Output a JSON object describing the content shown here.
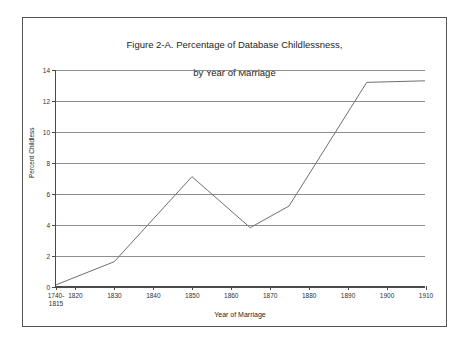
{
  "figure": {
    "title_line1": "Figure 2-A.  Percentage of Database Childlessness,",
    "title_line2": "by Year of Marriage"
  },
  "chart_data": {
    "type": "line",
    "title": "Figure 2-A.  Percentage of Database Childlessness, by Year of Marriage",
    "xlabel": "Year of Marriage",
    "ylabel": "Percent Childless",
    "ylim": [
      0,
      14
    ],
    "ytick_values": [
      0,
      2,
      4,
      6,
      8,
      10,
      12,
      14
    ],
    "ytick_labels": [
      "0",
      "2",
      "4",
      "6",
      "8",
      "10",
      "12",
      "14"
    ],
    "xlim": [
      1815,
      1910
    ],
    "xtick_major_values": [
      1815,
      1820,
      1830,
      1840,
      1850,
      1860,
      1870,
      1880,
      1890,
      1900,
      1910
    ],
    "xtick_major_labels": [
      "1740-\n1815",
      "1820",
      "1830",
      "1840",
      "1850",
      "1860",
      "1870",
      "1880",
      "1890",
      "1900",
      "1910"
    ],
    "xtick_minor_values": [
      1825,
      1835,
      1845,
      1855,
      1865,
      1875,
      1885,
      1895,
      1905
    ],
    "grid": "horizontal",
    "legend": "none",
    "series": [
      {
        "name": "Percent Childless",
        "x": [
          1815,
          1830,
          1850,
          1865,
          1875,
          1895,
          1910
        ],
        "values": [
          0.1,
          1.6,
          7.1,
          3.8,
          5.2,
          13.2,
          13.3
        ]
      }
    ],
    "line_color": "#6e6e6e",
    "grid_color": "#8d8d8d",
    "axis_color": "#4a4a4a"
  }
}
